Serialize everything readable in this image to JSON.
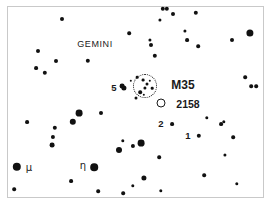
{
  "chart_data": {
    "type": "scatter",
    "title": "",
    "subtitle": "",
    "xlabel": "",
    "ylabel": "",
    "xlim": [
      0,
      273
    ],
    "ylim": [
      0,
      211
    ],
    "grid": false,
    "legend": "none",
    "frame": {
      "left": 7,
      "top": 6,
      "width": 257,
      "height": 192,
      "border_color": "#c9c9c9"
    },
    "background_color": "#ffffff",
    "star_color": "#111111",
    "series": [
      {
        "name": "stars",
        "points": [
          {
            "x": 62,
            "y": 19,
            "r": 2.0
          },
          {
            "x": 129,
            "y": 33,
            "r": 1.8
          },
          {
            "x": 160,
            "y": 20,
            "r": 1.6
          },
          {
            "x": 163,
            "y": 9,
            "r": 2.2
          },
          {
            "x": 167,
            "y": 9,
            "r": 2.2
          },
          {
            "x": 173,
            "y": 14,
            "r": 2.0
          },
          {
            "x": 196,
            "y": 13,
            "r": 2.2
          },
          {
            "x": 198,
            "y": 46,
            "r": 1.8
          },
          {
            "x": 185,
            "y": 31,
            "r": 1.6
          },
          {
            "x": 151,
            "y": 45,
            "r": 2.0
          },
          {
            "x": 155,
            "y": 56,
            "r": 2.2
          },
          {
            "x": 150,
            "y": 40,
            "r": 1.6
          },
          {
            "x": 187,
            "y": 40,
            "r": 1.9
          },
          {
            "x": 232,
            "y": 40,
            "r": 2.0
          },
          {
            "x": 250,
            "y": 33,
            "r": 3.6
          },
          {
            "x": 245,
            "y": 77,
            "r": 1.8
          },
          {
            "x": 251,
            "y": 86,
            "r": 1.8
          },
          {
            "x": 256,
            "y": 86,
            "r": 1.8
          },
          {
            "x": 38,
            "y": 51,
            "r": 2.0
          },
          {
            "x": 36,
            "y": 68,
            "r": 1.9
          },
          {
            "x": 45,
            "y": 73,
            "r": 2.2
          },
          {
            "x": 56,
            "y": 61,
            "r": 2.0
          },
          {
            "x": 88,
            "y": 61,
            "r": 2.2
          },
          {
            "x": 124,
            "y": 88,
            "r": 2.6
          },
          {
            "x": 101,
            "y": 113,
            "r": 2.0
          },
          {
            "x": 27,
            "y": 122,
            "r": 1.9
          },
          {
            "x": 73,
            "y": 122,
            "r": 3.2
          },
          {
            "x": 79,
            "y": 113,
            "r": 3.4
          },
          {
            "x": 55,
            "y": 128,
            "r": 2.2
          },
          {
            "x": 53,
            "y": 137,
            "r": 2.1
          },
          {
            "x": 52,
            "y": 145,
            "r": 2.4
          },
          {
            "x": 119,
            "y": 150,
            "r": 3.0
          },
          {
            "x": 141,
            "y": 143,
            "r": 3.4
          },
          {
            "x": 133,
            "y": 146,
            "r": 2.1
          },
          {
            "x": 123,
            "y": 141,
            "r": 1.7
          },
          {
            "x": 17,
            "y": 167,
            "r": 4.2
          },
          {
            "x": 94,
            "y": 167,
            "r": 3.8
          },
          {
            "x": 14,
            "y": 189,
            "r": 1.8
          },
          {
            "x": 71,
            "y": 181,
            "r": 1.9
          },
          {
            "x": 98,
            "y": 191,
            "r": 1.8
          },
          {
            "x": 123,
            "y": 193,
            "r": 1.8
          },
          {
            "x": 133,
            "y": 186,
            "r": 1.7
          },
          {
            "x": 144,
            "y": 178,
            "r": 2.6
          },
          {
            "x": 161,
            "y": 191,
            "r": 1.7
          },
          {
            "x": 159,
            "y": 157,
            "r": 1.8
          },
          {
            "x": 199,
            "y": 136,
            "r": 2.2
          },
          {
            "x": 172,
            "y": 124,
            "r": 1.9
          },
          {
            "x": 207,
            "y": 118,
            "r": 1.7
          },
          {
            "x": 221,
            "y": 124,
            "r": 1.9
          },
          {
            "x": 224,
            "y": 122,
            "r": 1.7
          },
          {
            "x": 233,
            "y": 137,
            "r": 1.8
          },
          {
            "x": 225,
            "y": 155,
            "r": 1.6
          },
          {
            "x": 204,
            "y": 175,
            "r": 1.8
          },
          {
            "x": 237,
            "y": 184,
            "r": 1.7
          },
          {
            "x": 122,
            "y": 86,
            "r": 2.4
          },
          {
            "x": 131,
            "y": 81,
            "r": 1.2
          },
          {
            "x": 137,
            "y": 77,
            "r": 1.3
          },
          {
            "x": 143,
            "y": 80,
            "r": 1.4
          },
          {
            "x": 147,
            "y": 84,
            "r": 1.5
          },
          {
            "x": 150,
            "y": 81,
            "r": 1.2
          },
          {
            "x": 145,
            "y": 88,
            "r": 1.6
          },
          {
            "x": 152,
            "y": 88,
            "r": 1.3
          },
          {
            "x": 140,
            "y": 92,
            "r": 1.8
          },
          {
            "x": 136,
            "y": 98,
            "r": 1.5
          },
          {
            "x": 144,
            "y": 95,
            "r": 1.2
          }
        ]
      }
    ],
    "cluster_markers": [
      {
        "name": "M35",
        "x": 145,
        "y": 86,
        "diameter": 22,
        "style": "dotted-circle"
      }
    ],
    "open_circle_markers": [
      {
        "name": "NGC 2158",
        "x": 161,
        "y": 103,
        "diameter": 7
      }
    ],
    "labels": [
      {
        "id": "constellation-gemini",
        "text": "GEMINI",
        "x": 95,
        "y": 44,
        "kind": "constellation"
      },
      {
        "id": "object-m35",
        "text": "M35",
        "x": 183,
        "y": 85,
        "kind": "object"
      },
      {
        "id": "object-2158",
        "text": "2158",
        "x": 188,
        "y": 104,
        "kind": "object-small"
      },
      {
        "id": "star-5",
        "text": "5",
        "x": 114,
        "y": 88,
        "kind": "star-number"
      },
      {
        "id": "star-2",
        "text": "2",
        "x": 161,
        "y": 124,
        "kind": "star-number"
      },
      {
        "id": "star-1",
        "text": "1",
        "x": 188,
        "y": 136,
        "kind": "star-number"
      },
      {
        "id": "star-mu",
        "text": "μ",
        "x": 29,
        "y": 168,
        "kind": "greek"
      },
      {
        "id": "star-eta",
        "text": "η",
        "x": 83,
        "y": 166,
        "kind": "greek"
      }
    ]
  }
}
